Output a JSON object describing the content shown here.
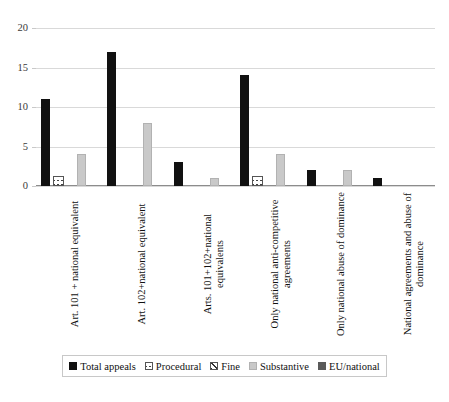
{
  "chart_data": {
    "type": "bar",
    "title": "",
    "subtitle": "",
    "xlabel": "",
    "ylabel": "",
    "ylim": [
      0,
      20
    ],
    "yticks": [
      0,
      5,
      10,
      15,
      20
    ],
    "grid": true,
    "legend_position": "bottom",
    "categories": [
      "Art. 101 + national equivalent",
      "Art. 102+national equivalent",
      "Arts. 101+102+national equivalents",
      "Only national anti-competitive agreements",
      "Only national abuse of dominance",
      "National agreements  and abuse of dominance"
    ],
    "series": [
      {
        "name": "Total appeals",
        "color": "#111111",
        "pattern": "solid",
        "values": [
          11,
          17,
          3,
          14,
          2,
          1
        ]
      },
      {
        "name": "Procedural",
        "color": "#ffffff",
        "pattern": "crosshatch",
        "values": [
          1,
          0,
          0,
          1,
          0,
          0
        ]
      },
      {
        "name": "Fine",
        "color": "#ffffff",
        "pattern": "diagonal",
        "values": [
          0,
          0,
          0,
          0,
          0,
          0
        ]
      },
      {
        "name": "Substantive",
        "color": "#c9c9c9",
        "pattern": "solid",
        "values": [
          4,
          8,
          1,
          4,
          2,
          0
        ]
      },
      {
        "name": "EU/national",
        "color": "#5a5a5a",
        "pattern": "solid",
        "values": [
          0,
          0,
          0,
          0,
          0,
          0
        ]
      }
    ]
  },
  "legend": {
    "items": [
      {
        "label": "Total appeals"
      },
      {
        "label": "Procedural"
      },
      {
        "label": "Fine"
      },
      {
        "label": "Substantive"
      },
      {
        "label": "EU/national"
      }
    ]
  }
}
